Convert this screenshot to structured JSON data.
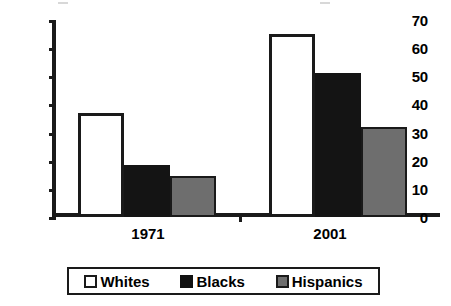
{
  "chart_data": {
    "type": "bar",
    "title": "",
    "xlabel": "",
    "ylabel": "",
    "categories": [
      "1971",
      "2001"
    ],
    "series": [
      {
        "name": "Whites",
        "color": "#ffffff",
        "values": [
          37,
          65
        ]
      },
      {
        "name": "Blacks",
        "color": "#141414",
        "values": [
          18.5,
          51
        ]
      },
      {
        "name": "Hispanics",
        "color": "#6e6e6e",
        "values": [
          14.5,
          32
        ]
      }
    ],
    "ylim": [
      0,
      70
    ],
    "ytick_labels": [
      "70",
      "60",
      "50",
      "40",
      "30",
      "20",
      "10",
      "0"
    ],
    "ytick_values": [
      70,
      60,
      50,
      40,
      30,
      20,
      10,
      0
    ],
    "grid": false,
    "legend_position": "bottom"
  },
  "axis": {
    "y_ticks": [
      {
        "label": "70",
        "value": 70
      },
      {
        "label": "60",
        "value": 60
      },
      {
        "label": "50",
        "value": 50
      },
      {
        "label": "40",
        "value": 40
      },
      {
        "label": "30",
        "value": 30
      },
      {
        "label": "20",
        "value": 20
      },
      {
        "label": "10",
        "value": 10
      },
      {
        "label": "0",
        "value": 0
      }
    ],
    "x_categories": [
      "1971",
      "2001"
    ]
  },
  "legend": {
    "entries": [
      {
        "label": "Whites",
        "swatch": "white"
      },
      {
        "label": "Blacks",
        "swatch": "black"
      },
      {
        "label": "Hispanics",
        "swatch": "gray"
      }
    ]
  }
}
